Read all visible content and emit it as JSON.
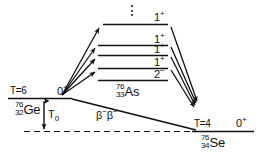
{
  "figure": {
    "kind": "nuclear-energy-level-diagram",
    "ink_color": "#111111",
    "background": "#ffffff"
  },
  "parent": {
    "isospin": "T=6",
    "mass_number": "76",
    "atomic_number": "32",
    "symbol": "Ge",
    "ground_state_jp": "0",
    "ground_state_parity": "+"
  },
  "intermediate": {
    "mass_number": "76",
    "atomic_number": "33",
    "symbol": "As",
    "levels": [
      {
        "jp": "1",
        "parity": "+"
      },
      {
        "jp": "1",
        "parity": "+"
      },
      {
        "jp": "1",
        "parity": "+"
      },
      {
        "jp": "1",
        "parity": "+"
      },
      {
        "jp": "2",
        "parity": "−"
      }
    ],
    "continuation_marker": "vertical-dots"
  },
  "daughter": {
    "isospin": "T=4",
    "mass_number": "76",
    "atomic_number": "34",
    "symbol": "Se",
    "ground_state_jp": "0",
    "ground_state_parity": "+"
  },
  "annotations": {
    "q_value": "T",
    "q_value_sub": "0",
    "double_beta": "β",
    "double_beta_sup": "−"
  }
}
